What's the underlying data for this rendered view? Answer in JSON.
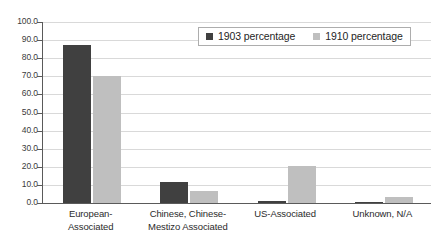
{
  "chart_data": {
    "type": "bar",
    "title": "",
    "subtitle": "",
    "xlabel": "",
    "ylabel": "",
    "ylim": [
      0.0,
      100.0
    ],
    "ytick_step": 10.0,
    "ytick_labels": [
      "0.0",
      "10.0",
      "20.0",
      "30.0",
      "40.0",
      "50.0",
      "60.0",
      "70.0",
      "80.0",
      "90.0",
      "100.0"
    ],
    "grid": "horizontal",
    "legend_position": "top-right",
    "categories": [
      "European-Associated",
      "Chinese, Chinese-Mestizo Associated",
      "US-Associated",
      "Unknown, N/A"
    ],
    "category_lines": [
      [
        "European-",
        "Associated"
      ],
      [
        "Chinese, Chinese-",
        "Mestizo Associated"
      ],
      [
        "US-Associated",
        ""
      ],
      [
        "Unknown, N/A",
        ""
      ]
    ],
    "series": [
      {
        "name": "1903 percentage",
        "color": "#404040",
        "values": [
          87.5,
          11.5,
          1.0,
          0.3
        ]
      },
      {
        "name": "1910 percentage",
        "color": "#bfbfbf",
        "values": [
          70.0,
          6.5,
          20.5,
          3.5
        ]
      }
    ]
  },
  "legend": {
    "items": [
      {
        "label": "1903 percentage",
        "color": "#404040"
      },
      {
        "label": "1910 percentage",
        "color": "#bfbfbf"
      }
    ]
  },
  "colors": {
    "series_1903": "#404040",
    "series_1910": "#bfbfbf",
    "gridline": "#d9d9d9",
    "axis": "#5a5a5a",
    "background": "#ffffff",
    "text": "#2b2b2b"
  }
}
